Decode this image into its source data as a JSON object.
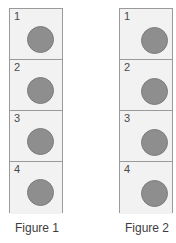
{
  "diagram": {
    "title": "",
    "colors": {
      "cell_fill": "#f2f2f2",
      "cell_border": "#9a9a9a",
      "disc_fill": "#8e8e8e",
      "disc_border": "#7b7b7b",
      "number_text": "#4a4a4a",
      "caption_text": "#3d3d3d",
      "background": "#ffffff"
    },
    "figures": [
      {
        "id": "figure-1",
        "caption": "Figure 1",
        "cells": [
          {
            "number": "1",
            "has_disc": true
          },
          {
            "number": "2",
            "has_disc": true
          },
          {
            "number": "3",
            "has_disc": true
          },
          {
            "number": "4",
            "has_disc": true
          }
        ]
      },
      {
        "id": "figure-2",
        "caption": "Figure 2",
        "cells": [
          {
            "number": "1",
            "has_disc": true
          },
          {
            "number": "2",
            "has_disc": true
          },
          {
            "number": "3",
            "has_disc": true
          },
          {
            "number": "4",
            "has_disc": true
          }
        ]
      }
    ]
  }
}
